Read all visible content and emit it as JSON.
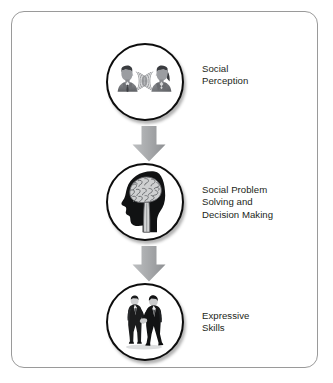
{
  "figure": {
    "frame": {
      "border_color": "#9a9a9a",
      "background": "#ffffff"
    },
    "stages": [
      {
        "id": "social-perception",
        "icon": "two-people-talking-sound-waves-icon",
        "label_lines": [
          "Social",
          "Perception"
        ]
      },
      {
        "id": "social-problem-solving-and-decision-making",
        "icon": "head-with-brain-icon",
        "label_lines": [
          "Social Problem",
          "Solving and",
          "Decision Making"
        ]
      },
      {
        "id": "expressive-skills",
        "icon": "two-people-handshake-icon",
        "label_lines": [
          "Expressive",
          "Skills"
        ]
      }
    ],
    "arrows": [
      {
        "id": "arrow-stage1-to-stage2",
        "icon": "down-arrow-icon",
        "direction": "down",
        "color": "#a7a9ac"
      },
      {
        "id": "arrow-stage2-to-stage3",
        "icon": "down-arrow-icon",
        "direction": "down",
        "color": "#a7a9ac"
      }
    ],
    "colors": {
      "text": "#231f20",
      "circle_outline": "#0d0d0d",
      "arrow_fill": "#a7a9ac",
      "frame_border": "#9a9a9a"
    }
  }
}
